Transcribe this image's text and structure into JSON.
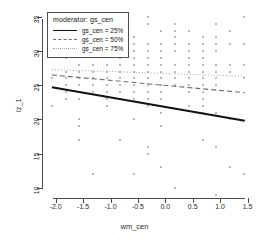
{
  "chart_data": {
    "type": "scatter",
    "title": "",
    "xlabel": "wm_cen",
    "ylabel": "lz_1",
    "xlim": [
      -2.25,
      1.6
    ],
    "ylim": [
      8.5,
      36
    ],
    "xticks": [
      "-2.0",
      "-1.5",
      "-1.0",
      "-0.5",
      "0.0",
      "0.5",
      "1.0",
      "1.5"
    ],
    "xtick_values": [
      -2.0,
      -1.5,
      -1.0,
      -0.5,
      0.0,
      0.5,
      1.0,
      1.5
    ],
    "yticks": [
      "10",
      "15",
      "20",
      "25",
      "30",
      "35"
    ],
    "ytick_values": [
      10,
      15,
      20,
      25,
      30,
      35
    ],
    "grid": false,
    "legend_position": "top-left",
    "legend_title": "moderator: gs_cen",
    "point_color": "#b9b9b9",
    "series": [
      {
        "name": "gs_cen = 25%",
        "style": "solid",
        "color": "#111111",
        "x": [
          -2.07,
          1.45
        ],
        "y": [
          24.7,
          19.8
        ]
      },
      {
        "name": "gs_cen = 50%",
        "style": "dashed",
        "color": "#6f6f6f",
        "x": [
          -2.07,
          1.45
        ],
        "y": [
          26.5,
          23.9
        ]
      },
      {
        "name": "gs_cen = 75%",
        "style": "dotted",
        "color": "#a9a9a9",
        "x": [
          -2.07,
          1.45
        ],
        "y": [
          27.3,
          26.3
        ]
      }
    ],
    "scatter": {
      "x": [
        -2.07,
        -2.07,
        -1.82,
        -1.82,
        -1.82,
        -1.82,
        -1.82,
        -1.82,
        -1.82,
        -1.57,
        -1.57,
        -1.57,
        -1.57,
        -1.57,
        -1.57,
        -1.57,
        -1.57,
        -1.57,
        -1.57,
        -1.57,
        -1.32,
        -1.32,
        -1.32,
        -1.32,
        -1.32,
        -1.32,
        -1.32,
        -1.07,
        -1.07,
        -1.07,
        -1.07,
        -1.07,
        -1.07,
        -1.07,
        -1.07,
        -0.82,
        -0.82,
        -0.82,
        -0.82,
        -0.82,
        -0.82,
        -0.82,
        -0.82,
        -0.57,
        -0.57,
        -0.57,
        -0.57,
        -0.57,
        -0.57,
        -0.57,
        -0.57,
        -0.57,
        -0.57,
        -0.57,
        -0.57,
        -0.32,
        -0.32,
        -0.32,
        -0.32,
        -0.32,
        -0.32,
        -0.32,
        -0.32,
        -0.32,
        -0.32,
        -0.32,
        -0.32,
        -0.32,
        -0.32,
        -0.07,
        -0.07,
        -0.07,
        -0.07,
        -0.07,
        -0.07,
        -0.07,
        -0.07,
        -0.07,
        -0.07,
        -0.07,
        -0.07,
        -0.07,
        -0.07,
        0.18,
        0.18,
        0.18,
        0.18,
        0.18,
        0.18,
        0.18,
        0.18,
        0.18,
        0.18,
        0.43,
        0.43,
        0.43,
        0.43,
        0.43,
        0.43,
        0.43,
        0.43,
        0.43,
        0.43,
        0.43,
        0.68,
        0.68,
        0.68,
        0.68,
        0.68,
        0.68,
        0.68,
        0.68,
        0.68,
        0.68,
        0.68,
        0.68,
        0.68,
        0.93,
        0.93,
        0.93,
        0.93,
        0.93,
        0.93,
        0.93,
        0.93,
        0.93,
        0.93,
        0.93,
        1.18,
        1.18,
        1.18,
        1.18,
        1.18,
        1.18,
        1.43,
        1.43,
        1.43,
        1.43,
        1.43
      ],
      "y": [
        26,
        22,
        31,
        29,
        27,
        26,
        25,
        24,
        23,
        32,
        30,
        28,
        27,
        26,
        25,
        24,
        23,
        20,
        19,
        17,
        31,
        28,
        27,
        26,
        25,
        24,
        12,
        30,
        28,
        27,
        26,
        25,
        24,
        23,
        22,
        31,
        29,
        28,
        27,
        26,
        25,
        24,
        17,
        32,
        31,
        30,
        29,
        28,
        27,
        26,
        25,
        24,
        23,
        20,
        12,
        35,
        34,
        31,
        30,
        29,
        28,
        27,
        26,
        25,
        24,
        23,
        22,
        16,
        15,
        33,
        31,
        30,
        29,
        28,
        27,
        26,
        25,
        24,
        23,
        22,
        21,
        19,
        13,
        10,
        34,
        33,
        32,
        31,
        30,
        28,
        27,
        26,
        25,
        24,
        33,
        31,
        30,
        29,
        28,
        27,
        26,
        25,
        24,
        22,
        21,
        32,
        31,
        30,
        29,
        28,
        27,
        26,
        25,
        24,
        23,
        22,
        17,
        16,
        9,
        34,
        32,
        31,
        30,
        28,
        27,
        26,
        25,
        21,
        20,
        13,
        33,
        31,
        28,
        27,
        26,
        12,
        35,
        31,
        28,
        27,
        26
      ]
    }
  }
}
